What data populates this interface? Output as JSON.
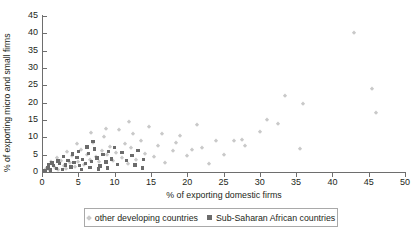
{
  "chart_data": {
    "type": "scatter",
    "title": "",
    "xlabel": "% of exporting domestic firms",
    "ylabel": "% of exporting micro and small firms",
    "xlim": [
      0,
      50
    ],
    "ylim": [
      0,
      45
    ],
    "xticks": [
      0,
      5,
      10,
      15,
      20,
      25,
      30,
      35,
      40,
      45,
      50
    ],
    "yticks": [
      0,
      5,
      10,
      15,
      20,
      25,
      30,
      35,
      40,
      45
    ],
    "grid": false,
    "legend_position": "bottom",
    "colors": {
      "other_developing": "#c9c9c9",
      "sub_saharan": "#6b6b6b",
      "axis": "#6e6e6e",
      "text": "#231f20"
    },
    "series": [
      {
        "name": "other developing countries",
        "marker": "diamond",
        "color": "#c9c9c9",
        "points": [
          [
            0.6,
            1.0
          ],
          [
            1.0,
            0.5
          ],
          [
            1.4,
            2.3
          ],
          [
            1.8,
            1.1
          ],
          [
            2.2,
            0.6
          ],
          [
            2.6,
            3.2
          ],
          [
            3.0,
            1.6
          ],
          [
            3.3,
            0.9
          ],
          [
            3.8,
            2.6
          ],
          [
            4.2,
            4.5
          ],
          [
            4.6,
            1.4
          ],
          [
            5.0,
            3.0
          ],
          [
            5.4,
            6.3
          ],
          [
            5.8,
            2.1
          ],
          [
            6.2,
            5.0
          ],
          [
            6.6,
            3.6
          ],
          [
            7.0,
            8.4
          ],
          [
            7.4,
            4.2
          ],
          [
            7.8,
            2.8
          ],
          [
            8.2,
            6.1
          ],
          [
            8.6,
            10.0
          ],
          [
            9.0,
            4.8
          ],
          [
            9.4,
            7.2
          ],
          [
            9.8,
            3.1
          ],
          [
            10.2,
            5.5
          ],
          [
            10.6,
            12.0
          ],
          [
            11.0,
            4.0
          ],
          [
            11.4,
            8.0
          ],
          [
            11.8,
            2.4
          ],
          [
            12.2,
            6.8
          ],
          [
            12.6,
            11.0
          ],
          [
            13.0,
            3.4
          ],
          [
            13.6,
            9.0
          ],
          [
            14.2,
            5.2
          ],
          [
            14.8,
            13.0
          ],
          [
            15.4,
            4.4
          ],
          [
            16.0,
            7.6
          ],
          [
            17.0,
            2.7
          ],
          [
            18.0,
            6.0
          ],
          [
            19.0,
            10.5
          ],
          [
            20.0,
            4.6
          ],
          [
            20.6,
            6.4
          ],
          [
            21.4,
            13.5
          ],
          [
            22.0,
            7.0
          ],
          [
            23.0,
            2.2
          ],
          [
            24.0,
            8.8
          ],
          [
            26.5,
            9.0
          ],
          [
            27.5,
            9.2
          ],
          [
            30.0,
            11.5
          ],
          [
            31.0,
            15.0
          ],
          [
            32.5,
            13.8
          ],
          [
            33.5,
            22.0
          ],
          [
            35.5,
            6.5
          ],
          [
            36.0,
            19.5
          ],
          [
            43.0,
            40.0
          ],
          [
            45.5,
            24.0
          ],
          [
            46.0,
            17.0
          ],
          [
            12.0,
            14.5
          ],
          [
            8.8,
            12.5
          ],
          [
            6.8,
            11.2
          ],
          [
            4.8,
            8.0
          ],
          [
            3.5,
            5.8
          ],
          [
            2.0,
            4.0
          ],
          [
            1.2,
            3.0
          ],
          [
            16.5,
            11.0
          ],
          [
            18.5,
            8.5
          ],
          [
            25.0,
            5.0
          ],
          [
            28.0,
            7.5
          ]
        ]
      },
      {
        "name": "Sub-Saharan African countries",
        "marker": "square",
        "color": "#6b6b6b",
        "points": [
          [
            0.4,
            0.4
          ],
          [
            0.8,
            1.2
          ],
          [
            1.2,
            0.6
          ],
          [
            1.6,
            1.8
          ],
          [
            2.0,
            1.0
          ],
          [
            2.4,
            2.4
          ],
          [
            2.8,
            0.8
          ],
          [
            3.2,
            2.0
          ],
          [
            3.6,
            3.4
          ],
          [
            4.0,
            1.4
          ],
          [
            4.4,
            2.8
          ],
          [
            4.8,
            4.2
          ],
          [
            5.2,
            1.9
          ],
          [
            5.6,
            3.6
          ],
          [
            6.0,
            2.5
          ],
          [
            6.4,
            5.4
          ],
          [
            6.8,
            3.0
          ],
          [
            7.2,
            6.6
          ],
          [
            7.6,
            4.0
          ],
          [
            8.0,
            1.7
          ],
          [
            8.4,
            5.0
          ],
          [
            8.8,
            2.9
          ],
          [
            9.2,
            6.0
          ],
          [
            9.6,
            3.8
          ],
          [
            10.0,
            7.0
          ],
          [
            10.4,
            2.2
          ],
          [
            11.0,
            5.6
          ],
          [
            11.6,
            3.3
          ],
          [
            12.4,
            4.8
          ],
          [
            13.2,
            6.2
          ],
          [
            14.0,
            3.6
          ],
          [
            7.0,
            8.8
          ],
          [
            6.2,
            7.2
          ],
          [
            5.0,
            6.0
          ],
          [
            4.2,
            5.2
          ],
          [
            3.0,
            4.4
          ],
          [
            2.2,
            3.2
          ],
          [
            1.4,
            2.6
          ],
          [
            0.9,
            2.0
          ],
          [
            13.8,
            1.2
          ],
          [
            12.8,
            2.0
          ],
          [
            9.0,
            1.1
          ],
          [
            7.8,
            0.9
          ],
          [
            6.6,
            1.3
          ],
          [
            5.4,
            0.7
          ]
        ]
      }
    ]
  },
  "legend": {
    "items": [
      {
        "label": "other developing countries"
      },
      {
        "label": "Sub-Saharan African countries"
      }
    ]
  }
}
